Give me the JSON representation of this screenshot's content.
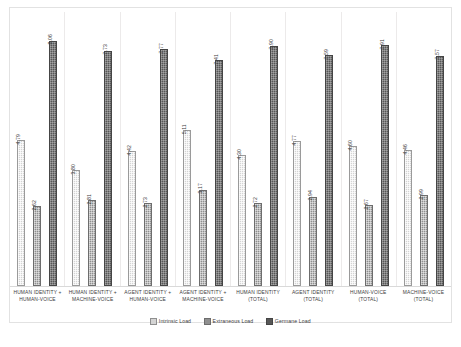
{
  "chart_data": {
    "type": "bar",
    "title": "",
    "subtitle": "",
    "xlabel": "",
    "ylabel": "",
    "ylim": [
      0,
      9
    ],
    "grid": false,
    "legend_position": "bottom",
    "orientation": "vertical",
    "grouping": "grouped",
    "data_labels_rotated": true,
    "categories": [
      "HUMAN IDENTITY + HUMAN-VOICE",
      "HUMAN IDENTITY + MACHINE-VOICE",
      "AGENT IDENTITY + HUMAN-VOICE",
      "AGENT IDENTITY + MACHINE-VOICE",
      "HUMAN IDENTITY (TOTAL)",
      "AGENT IDENTITY (TOTAL)",
      "HUMAN-VOICE (TOTAL)",
      "MACHINE-VOICE (TOTAL)"
    ],
    "series": [
      {
        "name": "Intrinsic Load",
        "color": "#d4d4d4",
        "values": [
          4.79,
          3.8,
          4.42,
          5.11,
          4.3,
          4.77,
          4.6,
          4.46
        ]
      },
      {
        "name": "Extraneous Load",
        "color": "#8f8f8f",
        "values": [
          2.62,
          2.81,
          2.73,
          3.17,
          2.72,
          2.94,
          2.67,
          2.99
        ]
      },
      {
        "name": "Germane Load",
        "color": "#575757",
        "values": [
          8.06,
          7.73,
          7.77,
          7.41,
          7.9,
          7.59,
          7.91,
          7.57
        ]
      }
    ]
  }
}
